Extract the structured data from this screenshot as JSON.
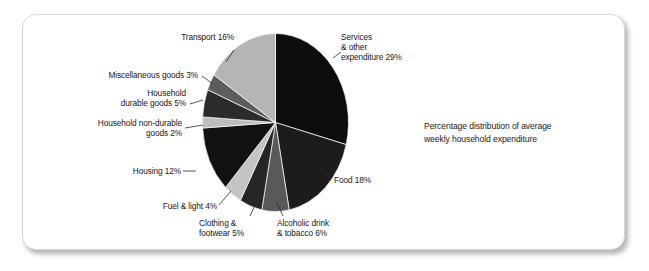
{
  "figure": {
    "caption": "Percentage distribution of average\nweekly household expenditure",
    "background_color": "#ffffff",
    "card_border_color": "#d8d8d8"
  },
  "chart_data": {
    "type": "pie",
    "title": "Percentage distribution of average weekly household expenditure",
    "xlabel": "",
    "ylabel": "",
    "units": "percent",
    "start_angle_deg": 0,
    "direction": "clockwise",
    "total": 100,
    "categories": [
      "Services & other expenditure",
      "Food",
      "Alcoholic drink & tobacco",
      "Clothing & footwear",
      "Fuel & light",
      "Housing",
      "Household non-durable goods",
      "Household durable goods",
      "Miscellaneous goods",
      "Transport"
    ],
    "values": [
      29,
      18,
      6,
      5,
      4,
      12,
      2,
      5,
      3,
      16
    ],
    "colors": [
      "#0d0d0d",
      "#1c1c1c",
      "#595959",
      "#262626",
      "#c4c4c4",
      "#111111",
      "#bdbdbd",
      "#2b2b2b",
      "#5d5d5d",
      "#b5b5b5"
    ],
    "legend": "none",
    "labels_inline": true
  },
  "slice_labels": [
    {
      "id": "services",
      "text": "Services\n& other\nexpenditure 29%"
    },
    {
      "id": "food",
      "text": "Food 18%"
    },
    {
      "id": "alcoholic-drink",
      "text": "Alcoholic drink\n& tobacco 6%"
    },
    {
      "id": "clothing-footwear",
      "text": "Clothing &\nfootwear 5%"
    },
    {
      "id": "fuel-light",
      "text": "Fuel & light 4%"
    },
    {
      "id": "housing",
      "text": "Housing 12%"
    },
    {
      "id": "household-non-durable",
      "text": "Household non-durable\ngoods 2%"
    },
    {
      "id": "household-durable",
      "text": "Household\ndurable goods 5%"
    },
    {
      "id": "miscellaneous",
      "text": "Miscellaneous goods 3%"
    },
    {
      "id": "transport",
      "text": "Transport 16%"
    }
  ]
}
